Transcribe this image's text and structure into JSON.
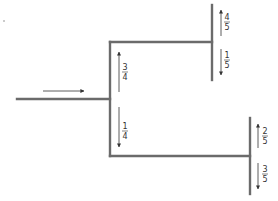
{
  "diagram": {
    "type": "branching-probability-tree",
    "colors": {
      "line": "#6b6b6b",
      "arrow": "#333333",
      "text": "#333333",
      "background": "#ffffff"
    },
    "input_arrow": {
      "direction": "right"
    },
    "branches": [
      {
        "name": "upper",
        "trunk_fraction": {
          "num": "3",
          "den": "4",
          "direction": "up"
        },
        "sub": [
          {
            "num": "4",
            "den": "5",
            "direction": "up"
          },
          {
            "num": "1",
            "den": "5",
            "direction": "down"
          }
        ]
      },
      {
        "name": "lower",
        "trunk_fraction": {
          "num": "1",
          "den": "4",
          "direction": "down"
        },
        "sub": [
          {
            "num": "2",
            "den": "5",
            "direction": "up"
          },
          {
            "num": "3",
            "den": "5",
            "direction": "down"
          }
        ]
      }
    ]
  }
}
